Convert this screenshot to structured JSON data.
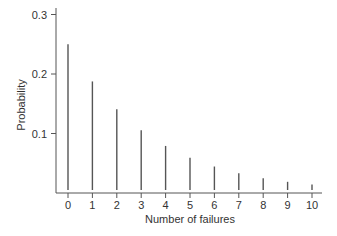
{
  "chart_data": {
    "type": "bar",
    "title": "",
    "xlabel": "Number of failures",
    "ylabel": "Probability",
    "categories": [
      "0",
      "1",
      "2",
      "3",
      "4",
      "5",
      "6",
      "7",
      "8",
      "9",
      "10"
    ],
    "values": [
      0.25,
      0.1875,
      0.1406,
      0.1055,
      0.0791,
      0.0593,
      0.0445,
      0.0334,
      0.025,
      0.0188,
      0.0141
    ],
    "ylim": [
      0,
      0.3
    ],
    "yticks": [
      0.1,
      0.2,
      0.3
    ],
    "ytick_labels": [
      "0.1",
      "0.2",
      "0.3"
    ],
    "grid": false,
    "legend": null,
    "style": "spike"
  },
  "colors": {
    "axis": "#555555",
    "bar": "#555555",
    "text": "#333333"
  }
}
